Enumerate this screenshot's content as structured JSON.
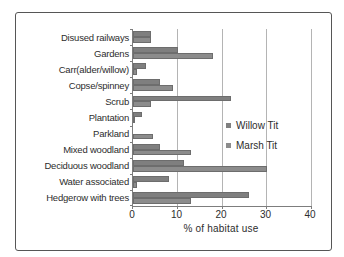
{
  "figure": {
    "background_color": "#ffffff",
    "border_color": "#565656"
  },
  "chart_data": {
    "type": "bar",
    "orientation": "horizontal",
    "title": "",
    "xlabel": "% of habitat use",
    "ylabel": "",
    "xlim": [
      0,
      40
    ],
    "xticks": [
      0,
      10,
      20,
      30,
      40
    ],
    "grid": "vertical gridlines at each x tick",
    "legend_position": "inside right",
    "categories": [
      "Disused railways",
      "Gardens",
      "Carr(alder/willow)",
      "Copse/spinney",
      "Scrub",
      "Plantation",
      "Parkland",
      "Mixed woodland",
      "Deciduous woodland",
      "Water associated",
      "Hedgerow with trees"
    ],
    "series": [
      {
        "name": "Willow Tit",
        "color": "#7f7f7f",
        "values": [
          4,
          10,
          3,
          6,
          22,
          2,
          0,
          6,
          11.5,
          8,
          26
        ]
      },
      {
        "name": "Marsh Tit",
        "color": "#8c8c8c",
        "values": [
          4,
          18,
          1,
          9,
          4,
          0.5,
          4.5,
          13,
          30,
          1,
          13
        ]
      }
    ]
  }
}
